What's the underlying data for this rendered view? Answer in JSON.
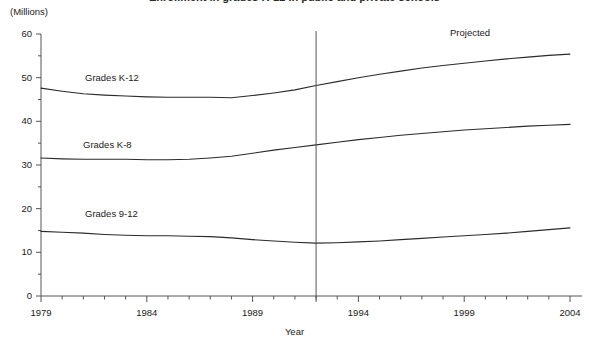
{
  "title": "",
  "axis_unit_label": "(Millions)",
  "xaxis_title": "Year",
  "projected_label": "Projected",
  "series_labels": {
    "k12": "Grades K-12",
    "k8": "Grades K-8",
    "g912": "Grades 9-12"
  },
  "ytick_labels": [
    "60",
    "50",
    "40",
    "30",
    "20",
    "10",
    "0"
  ],
  "xtick_labels": [
    "1979",
    "1984",
    "1989",
    "1994",
    "1999",
    "2004"
  ],
  "colors": {
    "line": "#2b2b2b",
    "axis": "#555555",
    "divider": "#555555",
    "background": "#ffffff",
    "text": "#1a1a1a"
  },
  "chart_data": {
    "type": "line",
    "title": "Enrollment in grades K-12 in public and private schools",
    "subtitle": "",
    "xlabel": "Year",
    "ylabel": "(Millions)",
    "xlim": [
      1979,
      2004
    ],
    "ylim": [
      0,
      60
    ],
    "ytick_values": [
      0,
      10,
      20,
      30,
      40,
      50,
      60
    ],
    "yminor_tick_values": [
      5,
      15,
      25,
      35,
      45,
      55
    ],
    "xtick_values": [
      1979,
      1984,
      1989,
      1994,
      1999,
      2004
    ],
    "xminor_tick_step": 1,
    "grid": false,
    "legend_position": "inline-labels",
    "annotations": [
      {
        "text": "Projected",
        "x": 1998.2,
        "y": 57.8
      },
      {
        "text": "Grades K-12",
        "x": 1982.2,
        "y": 50.2
      },
      {
        "text": "Grades K-8",
        "x": 1981.8,
        "y": 34.6
      },
      {
        "text": "Grades 9-12",
        "x": 1982.2,
        "y": 18.0
      }
    ],
    "vertical_divider": {
      "x": 1992,
      "label": "actual/projected boundary"
    },
    "x": [
      1979,
      1980,
      1981,
      1982,
      1983,
      1984,
      1985,
      1986,
      1987,
      1988,
      1989,
      1990,
      1991,
      1992,
      1993,
      1994,
      1995,
      1996,
      1997,
      1998,
      1999,
      2000,
      2001,
      2002,
      2003,
      2004
    ],
    "series": [
      {
        "name": "Grades K-12",
        "values": [
          47.6,
          46.9,
          46.3,
          46.0,
          45.8,
          45.6,
          45.5,
          45.5,
          45.5,
          45.4,
          45.9,
          46.5,
          47.2,
          48.2,
          49.1,
          50.0,
          50.8,
          51.5,
          52.2,
          52.8,
          53.3,
          53.8,
          54.3,
          54.7,
          55.1,
          55.4
        ]
      },
      {
        "name": "Grades K-8",
        "values": [
          31.6,
          31.4,
          31.3,
          31.3,
          31.3,
          31.2,
          31.2,
          31.3,
          31.6,
          32.0,
          32.7,
          33.4,
          34.0,
          34.6,
          35.2,
          35.8,
          36.3,
          36.8,
          37.2,
          37.6,
          38.0,
          38.3,
          38.6,
          38.9,
          39.1,
          39.3
        ]
      },
      {
        "name": "Grades 9-12",
        "values": [
          14.8,
          14.6,
          14.4,
          14.1,
          13.9,
          13.8,
          13.8,
          13.7,
          13.6,
          13.3,
          12.9,
          12.6,
          12.3,
          12.1,
          12.2,
          12.4,
          12.6,
          12.9,
          13.2,
          13.5,
          13.8,
          14.1,
          14.4,
          14.8,
          15.2,
          15.6
        ]
      }
    ]
  }
}
